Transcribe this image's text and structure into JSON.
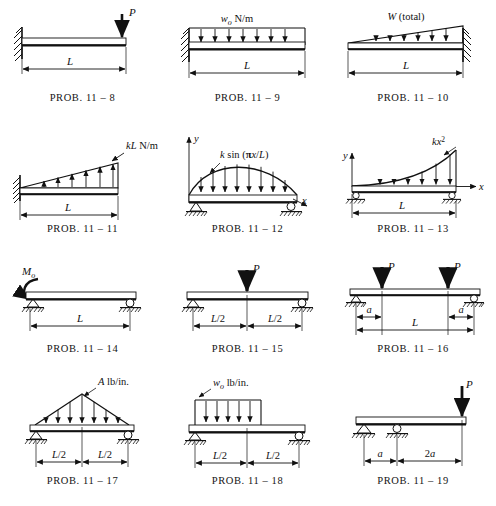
{
  "figure": {
    "kind": "beam-loading-problem-figures",
    "rows": 4,
    "columns": 3,
    "caption_prefix": "PROB.",
    "chapter": "11"
  },
  "labels": {
    "L": "L",
    "L_half": "L/2",
    "a": "a",
    "two_a": "2a",
    "P": "P",
    "x": "x",
    "y": "y"
  },
  "panels": [
    {
      "id": "prob-11-8",
      "caption": "PROB. 11 – 8",
      "support_left": "fixed-wall",
      "support_right": "free",
      "load_label": "P",
      "load_type": "point-load-end-down",
      "dimension_labels": [
        "L"
      ]
    },
    {
      "id": "prob-11-9",
      "caption": "PROB. 11 – 9",
      "support_left": "fixed-wall",
      "support_right": "free",
      "load_label": "w₀ N/m",
      "load_label_main": "w",
      "load_label_sub": "o",
      "load_label_tail": " N/m",
      "load_type": "uniform-distributed-down",
      "dimension_labels": [
        "L"
      ]
    },
    {
      "id": "prob-11-10",
      "caption": "PROB. 11 – 10",
      "support_left": "free",
      "support_right": "fixed-wall",
      "load_label": "W (total)",
      "load_type": "triangular-increasing-right-down",
      "dimension_labels": [
        "L"
      ]
    },
    {
      "id": "prob-11-11",
      "caption": "PROB. 11 – 11",
      "support_left": "fixed-wall",
      "support_right": "free",
      "load_label": "kL N/m",
      "load_label_main": "kL",
      "load_label_tail": " N/m",
      "load_type": "triangular-increasing-right-up",
      "dimension_labels": [
        "L"
      ]
    },
    {
      "id": "prob-11-12",
      "caption": "PROB. 11 – 12",
      "support_left": "pin",
      "support_right": "roller",
      "load_label": "k sin(πx/L)",
      "load_type": "sinusoidal-down",
      "axis_labels": [
        "y",
        "x"
      ],
      "dimension_labels": []
    },
    {
      "id": "prob-11-13",
      "caption": "PROB. 11 – 13",
      "support_left": "roller",
      "support_right": "roller",
      "load_label": "kx²",
      "load_label_main": "kx",
      "load_label_sup": "2",
      "load_type": "parabolic-increasing-right-down",
      "axis_labels": [
        "y",
        "x"
      ],
      "dimension_labels": [
        "L"
      ]
    },
    {
      "id": "prob-11-14",
      "caption": "PROB. 11 – 14",
      "support_left": "pin",
      "support_right": "roller",
      "load_label": "M₀",
      "load_label_main": "M",
      "load_label_sub": "o",
      "load_type": "applied-moment-left",
      "dimension_labels": [
        "L"
      ]
    },
    {
      "id": "prob-11-15",
      "caption": "PROB. 11 – 15",
      "support_left": "pin",
      "support_right": "roller",
      "load_label": "P",
      "load_type": "point-load-center-down",
      "dimension_labels": [
        "L/2",
        "L/2"
      ]
    },
    {
      "id": "prob-11-16",
      "caption": "PROB. 11 – 16",
      "support_left": "pin",
      "support_right": "roller",
      "load_label": "P",
      "load_label_2": "P",
      "load_type": "two-point-loads-symmetric-down",
      "dimension_labels": [
        "a",
        "L",
        "a"
      ]
    },
    {
      "id": "prob-11-17",
      "caption": "PROB. 11 – 17",
      "support_left": "pin",
      "support_right": "roller",
      "load_label": "A lb/in.",
      "load_label_main": "A",
      "load_label_tail": " lb/in.",
      "load_type": "triangular-peak-center-down",
      "dimension_labels": [
        "L/2",
        "L/2"
      ]
    },
    {
      "id": "prob-11-18",
      "caption": "PROB. 11 – 18",
      "support_left": "pin",
      "support_right": "roller",
      "load_label": "w₀ lb/in.",
      "load_label_main": "w",
      "load_label_sub": "o",
      "load_label_tail": " lb/in.",
      "load_type": "uniform-distributed-left-half-down",
      "dimension_labels": [
        "L/2",
        "L/2"
      ]
    },
    {
      "id": "prob-11-19",
      "caption": "PROB. 11 – 19",
      "support_left": "pin",
      "support_mid": "roller",
      "support_right": "free",
      "load_label": "P",
      "load_type": "point-load-overhang-end-down",
      "dimension_labels": [
        "a",
        "2a"
      ]
    }
  ]
}
